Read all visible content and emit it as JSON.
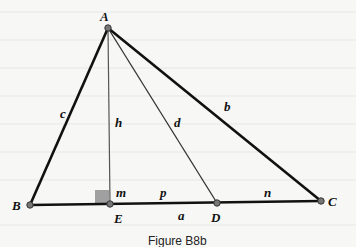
{
  "figure": {
    "caption": "Figure B8b",
    "vertices": {
      "A": {
        "label": "A",
        "x": 108,
        "y": 28
      },
      "B": {
        "label": "B",
        "x": 30,
        "y": 205
      },
      "C": {
        "label": "C",
        "x": 321,
        "y": 201
      },
      "D": {
        "label": "D",
        "x": 217,
        "y": 203
      },
      "E": {
        "label": "E",
        "x": 110,
        "y": 204
      }
    },
    "segment_labels": {
      "a": "a",
      "b": "b",
      "c": "c",
      "d": "d",
      "h": "h",
      "m": "m",
      "n": "n",
      "p": "p"
    },
    "colors": {
      "line": "#111111",
      "thin_line": "#555555",
      "right_angle_marker": "#a0a0a0",
      "point": "#666666"
    }
  }
}
